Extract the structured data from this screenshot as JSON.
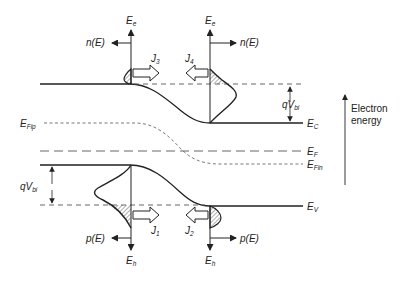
{
  "diagram": {
    "type": "pn-junction-energy-band-diagram",
    "axis_title": {
      "line1": "Electron",
      "line2": "energy"
    },
    "levels": {
      "conduction_band": {
        "label_main": "E",
        "label_sub": "C"
      },
      "fermi": {
        "label_main": "E",
        "label_sub": "F"
      },
      "intrinsic_p": {
        "label_main": "E",
        "label_sub": "Fip"
      },
      "intrinsic_n": {
        "label_main": "E",
        "label_sub": "Fin"
      },
      "valence_band": {
        "label_main": "E",
        "label_sub": "V"
      }
    },
    "built_in": {
      "top": {
        "label_main": "qV",
        "label_sub": "bi"
      },
      "bottom": {
        "label_main": "qV",
        "label_sub": "bi"
      }
    },
    "electron_axes": [
      {
        "energy_main": "E",
        "energy_sub": "e",
        "density": "n(E)",
        "direction": "left"
      },
      {
        "energy_main": "E",
        "energy_sub": "e",
        "density": "n(E)",
        "direction": "right"
      }
    ],
    "hole_axes": [
      {
        "energy_main": "E",
        "energy_sub": "h",
        "density": "p(E)",
        "direction": "left"
      },
      {
        "energy_main": "E",
        "energy_sub": "h",
        "density": "p(E)",
        "direction": "right"
      }
    ],
    "currents": [
      {
        "main": "J",
        "sub": "1",
        "direction": "right"
      },
      {
        "main": "J",
        "sub": "2",
        "direction": "left"
      },
      {
        "main": "J",
        "sub": "3",
        "direction": "right"
      },
      {
        "main": "J",
        "sub": "4",
        "direction": "left"
      }
    ],
    "colors": {
      "line": "#222222",
      "dashed": "#555555",
      "background": "#ffffff"
    }
  }
}
